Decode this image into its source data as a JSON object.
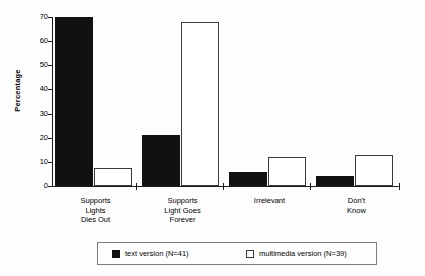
{
  "chart_data": {
    "type": "bar",
    "title": "",
    "subtitle": "",
    "xlabel": "",
    "ylabel": "Percentage",
    "ylim": [
      0,
      70
    ],
    "ytick_labels": [
      "70",
      "60",
      "50",
      "40",
      "30",
      "20",
      "10",
      "0"
    ],
    "ytick_values": [
      70,
      60,
      50,
      40,
      30,
      20,
      10,
      0
    ],
    "grid": false,
    "legend_position": "bottom",
    "categories": [
      "Supports\nLights\nDies Out",
      "Supports\nLight Goes\nForever",
      "Irrelevant",
      "Don't\nKnow"
    ],
    "series": [
      {
        "name": "text version (N=41)",
        "swatch": "dark",
        "color": "#111111",
        "values": [
          70,
          21,
          6,
          4
        ]
      },
      {
        "name": "multimedia version (N=39)",
        "swatch": "light",
        "color": "#ffffff",
        "values": [
          7.5,
          68,
          12,
          13
        ]
      }
    ]
  },
  "legend": {
    "entries": [
      {
        "label": "text version (N=41)",
        "swatch": "dark"
      },
      {
        "label": "multimedia version (N=39)",
        "swatch": "light"
      }
    ]
  },
  "axis": {
    "y_title": "Percentage"
  }
}
